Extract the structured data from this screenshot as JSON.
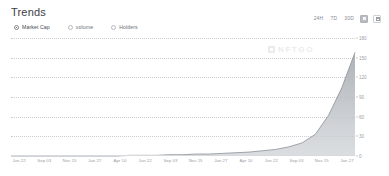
{
  "header": {
    "title": "Trends"
  },
  "metric_options": [
    {
      "label": "Market Cap",
      "selected": true
    },
    {
      "label": "volume",
      "selected": false
    },
    {
      "label": "Holders",
      "selected": false
    }
  ],
  "ranges": [
    {
      "label": "24H",
      "selected": false
    },
    {
      "label": "7D",
      "selected": false
    },
    {
      "label": "30D",
      "selected": false
    }
  ],
  "icon_buttons": [
    {
      "name": "chart-view-icon",
      "selected": true
    },
    {
      "name": "calendar-icon",
      "selected": false
    }
  ],
  "watermark": {
    "text": "NFTGO",
    "icon": "nftgo-logo-icon"
  },
  "chart_data": {
    "type": "area",
    "title": "Trends",
    "xlabel": "",
    "ylabel": "",
    "grid": true,
    "legend": "none",
    "series_color": "#8c9197",
    "fill_color": "#b9bec3",
    "ylim": [
      0,
      180
    ],
    "yticks": [
      0,
      30,
      60,
      90,
      120,
      150,
      180
    ],
    "ytick_labels": [
      "0",
      "30",
      "60",
      "90",
      "120",
      "150",
      "180"
    ],
    "xtick_labels": [
      "Jun 22",
      "Sep 03",
      "Nov 15",
      "Jan 27",
      "Apr 10",
      "Jun 22",
      "Sep 03",
      "Nov 15",
      "Jan 27",
      "Apr 10",
      "Jun 22",
      "Sep 03",
      "Nov 15",
      "Jan 27"
    ],
    "x": [
      0,
      1,
      2,
      3,
      4,
      5,
      6,
      7,
      8,
      9,
      10,
      11,
      12,
      13,
      14,
      15,
      16,
      17,
      18,
      19,
      20,
      21,
      22,
      23,
      24,
      25,
      26
    ],
    "values": [
      0,
      0,
      0,
      0,
      0,
      0,
      0,
      0,
      0,
      1,
      1,
      1,
      2,
      2,
      3,
      3,
      4,
      5,
      6,
      8,
      10,
      14,
      20,
      33,
      62,
      104,
      158
    ]
  }
}
